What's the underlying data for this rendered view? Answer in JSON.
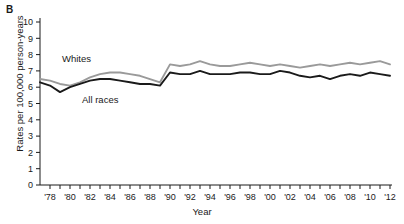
{
  "panel": {
    "label": "B"
  },
  "axes": {
    "ylabel": "Rates per 100,000 person-years",
    "xlabel": "Year",
    "yticks": [
      "0",
      "1",
      "2",
      "3",
      "4",
      "5",
      "6",
      "7",
      "8",
      "9",
      "10"
    ],
    "xticklabels": [
      "'78",
      "'80",
      "'82",
      "'84",
      "'86",
      "'88",
      "'90",
      "'92",
      "'94",
      "'96",
      "'98",
      "'00",
      "'02",
      "'04",
      "'06",
      "'08",
      "'10",
      "'12"
    ]
  },
  "series_labels": {
    "whites": "Whites",
    "all_races": "All races"
  },
  "colors": {
    "whites": "#9a9a9a",
    "all_races": "#1a1a1a",
    "axis": "#1a1a1a"
  },
  "chart_data": {
    "type": "line",
    "title": "",
    "xlabel": "Year",
    "ylabel": "Rates per 100,000 person-years",
    "xlim": [
      1977,
      2012
    ],
    "ylim": [
      0,
      10
    ],
    "grid": false,
    "legend": "inline-annotations",
    "x": [
      1977,
      1978,
      1979,
      1980,
      1981,
      1982,
      1983,
      1984,
      1985,
      1986,
      1987,
      1988,
      1989,
      1990,
      1991,
      1992,
      1993,
      1994,
      1995,
      1996,
      1997,
      1998,
      1999,
      2000,
      2001,
      2002,
      2003,
      2004,
      2005,
      2006,
      2007,
      2008,
      2009,
      2010,
      2011,
      2012
    ],
    "series": [
      {
        "name": "Whites",
        "color": "#9a9a9a",
        "values": [
          6.5,
          6.4,
          6.2,
          6.1,
          6.3,
          6.6,
          6.8,
          6.9,
          6.9,
          6.8,
          6.7,
          6.5,
          6.3,
          7.4,
          7.3,
          7.4,
          7.6,
          7.4,
          7.3,
          7.3,
          7.4,
          7.5,
          7.4,
          7.3,
          7.4,
          7.3,
          7.2,
          7.3,
          7.4,
          7.3,
          7.4,
          7.5,
          7.4,
          7.5,
          7.6,
          7.4
        ]
      },
      {
        "name": "All races",
        "color": "#1a1a1a",
        "values": [
          6.3,
          6.1,
          5.7,
          6.0,
          6.2,
          6.4,
          6.5,
          6.5,
          6.4,
          6.3,
          6.2,
          6.2,
          6.1,
          6.9,
          6.8,
          6.8,
          7.0,
          6.8,
          6.8,
          6.8,
          6.9,
          6.9,
          6.8,
          6.8,
          7.0,
          6.9,
          6.7,
          6.6,
          6.7,
          6.5,
          6.7,
          6.8,
          6.7,
          6.9,
          6.8,
          6.7
        ]
      }
    ]
  }
}
